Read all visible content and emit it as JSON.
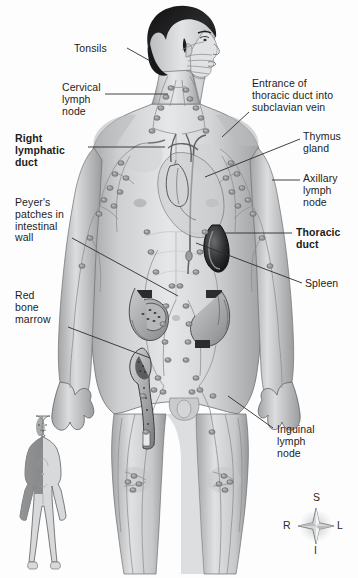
{
  "figure": {
    "background_color": "#fdfdfd",
    "ink_color": "#1c1c1c",
    "width": 358,
    "height": 578
  },
  "labels": [
    {
      "id": "tonsils",
      "text": "Tonsils",
      "bold": false,
      "align": "left",
      "x": 74,
      "y": 43
    },
    {
      "id": "cervical-lymph-node",
      "text": "Cervical\nlymph\nnode",
      "bold": false,
      "align": "left",
      "x": 62,
      "y": 82
    },
    {
      "id": "right-lymphatic-duct",
      "text": "Right\nlymphatic\nduct",
      "bold": true,
      "align": "left",
      "x": 15,
      "y": 133
    },
    {
      "id": "peyers-patches",
      "text": "Peyer's\npatches in\nintestinal\nwall",
      "bold": false,
      "align": "left",
      "x": 15,
      "y": 197
    },
    {
      "id": "red-bone-marrow",
      "text": "Red\nbone\nmarrow",
      "bold": false,
      "align": "left",
      "x": 15,
      "y": 290
    },
    {
      "id": "entrance-thoracic-duct",
      "text": "Entrance of\nthoracic duct into\nsubclavian vein",
      "bold": false,
      "align": "left",
      "x": 252,
      "y": 78
    },
    {
      "id": "thymus-gland",
      "text": "Thymus\ngland",
      "bold": false,
      "align": "left",
      "x": 303,
      "y": 131
    },
    {
      "id": "axillary-lymph-node",
      "text": "Axillary\nlymph\nnode",
      "bold": false,
      "align": "left",
      "x": 303,
      "y": 173
    },
    {
      "id": "thoracic-duct",
      "text": "Thoracic\nduct",
      "bold": true,
      "align": "left",
      "x": 296,
      "y": 227
    },
    {
      "id": "spleen",
      "text": "Spleen",
      "bold": false,
      "align": "left",
      "x": 305,
      "y": 278
    },
    {
      "id": "inguinal-lymph-node",
      "text": "Inguinal\nlymph\nnode",
      "bold": false,
      "align": "left",
      "x": 277,
      "y": 424
    }
  ],
  "leader_lines": [
    {
      "id": "tonsils-leader",
      "points": "127,48 152,62"
    },
    {
      "id": "cervical-leader",
      "points": "105,94 168,94"
    },
    {
      "id": "right-lymphatic-duct-leader",
      "points": "88,147 165,147"
    },
    {
      "id": "peyers-patches-leader",
      "points": "72,238 178,296"
    },
    {
      "id": "red-bone-marrow-leader",
      "points": "68,327 150,358"
    },
    {
      "id": "entrance-thoracic-duct-leader",
      "points": "249,112 222,137"
    },
    {
      "id": "thymus-gland-leader",
      "points": "300,139 205,177"
    },
    {
      "id": "axillary-lymph-node-leader",
      "points": "300,180 272,180"
    },
    {
      "id": "thoracic-duct-leader",
      "points": "292,233 224,233"
    },
    {
      "id": "spleen-leader",
      "points": "302,283 196,243"
    },
    {
      "id": "inguinal-lymph-node-leader",
      "points": "273,428 228,396"
    }
  ],
  "compass": {
    "id": "orientation-compass",
    "center_x": 316,
    "center_y": 526,
    "superior": "S",
    "inferior": "I",
    "right": "R",
    "left": "L"
  },
  "inset": {
    "id": "orientation-body-inset",
    "description": "small whole-body figure with the right upper quadrant shaded",
    "x": 16,
    "y": 412,
    "width": 68,
    "height": 152,
    "shade_color": "#8a8c8e",
    "body_color": "#d8d9da"
  },
  "anatomy": {
    "figure_description": "anterior view of a male body showing the lymphatic vessels and lymph nodes",
    "organs": [
      "tonsils",
      "cervical lymph nodes",
      "right lymphatic duct",
      "thoracic duct",
      "thymus gland",
      "axillary lymph nodes",
      "spleen",
      "Peyer's patches",
      "red bone marrow",
      "inguinal lymph nodes"
    ]
  }
}
